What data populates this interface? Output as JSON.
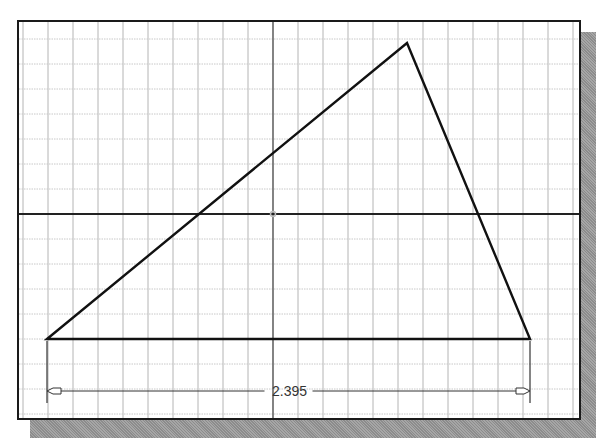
{
  "canvas": {
    "background": "#ffffff",
    "frame_color": "#1a1a1a",
    "shadow_color": "#9a9a9a",
    "grid": {
      "spacing_px": 25,
      "minor_color": "#c8c8c8",
      "major_color": "#b4b4b4"
    },
    "axes": {
      "x_axis_y": 212,
      "y_axis_x": 271,
      "x_axis_color": "#222222",
      "y_axis_color": "#555555",
      "origin_marker_color": "#bbbbbb"
    }
  },
  "sketch": {
    "shape": "triangle",
    "vertices": [
      {
        "label": "A",
        "x": 45,
        "y": 337
      },
      {
        "label": "B",
        "x": 405,
        "y": 41
      },
      {
        "label": "C",
        "x": 528,
        "y": 337
      }
    ],
    "line_color": "#111111"
  },
  "dimension": {
    "value": "2.395",
    "line_y": 389,
    "start_x": 45,
    "end_x": 528,
    "color": "#333333"
  }
}
